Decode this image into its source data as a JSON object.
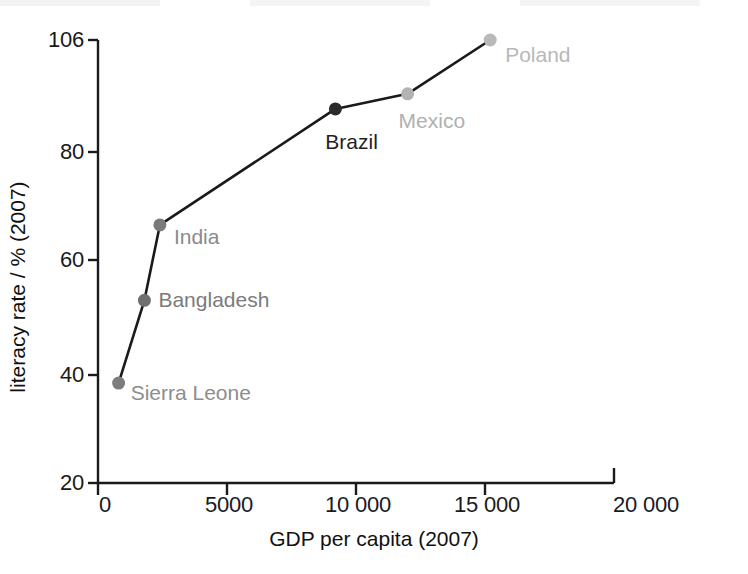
{
  "chart_data": {
    "type": "line",
    "title": "",
    "subtitle": "",
    "xlabel": "GDP per capita (2007)",
    "ylabel": "literacy rate / % (2007)",
    "xlim": [
      0,
      20000
    ],
    "ylim": [
      20,
      106
    ],
    "grid": false,
    "legend": "none",
    "xticks": [
      0,
      5000,
      10000,
      15000,
      20000
    ],
    "xticklabels": [
      "0",
      "5000",
      "10 000",
      "15 000",
      "20 000"
    ],
    "yticks": [
      20,
      40,
      60,
      80,
      106
    ],
    "yticklabels": [
      "20",
      "40",
      "60",
      "80",
      "106"
    ],
    "series": [
      {
        "name": "countries",
        "x": [
          800,
          1800,
          2400,
          9200,
          12000,
          15200
        ],
        "y": [
          38.5,
          53,
          66.5,
          90,
          93.5,
          106
        ],
        "labels": [
          "Sierra Leone",
          "Bangladesh",
          "India",
          "Brazil",
          "Mexico",
          "Poland"
        ]
      }
    ],
    "annotations": [
      {
        "text": "Sierra Leone",
        "x": 800,
        "y": 38.5,
        "color": "#8d8d8d"
      },
      {
        "text": "Bangladesh",
        "x": 1800,
        "y": 53,
        "color": "#7b7b7b"
      },
      {
        "text": "India",
        "x": 2400,
        "y": 66.5,
        "color": "#8a8a8a"
      },
      {
        "text": "Brazil",
        "x": 9200,
        "y": 90,
        "color": "#1f1f1f"
      },
      {
        "text": "Mexico",
        "x": 12000,
        "y": 93.5,
        "color": "#b0b0b0"
      },
      {
        "text": "Poland",
        "x": 15200,
        "y": 106,
        "color": "#b8b8b8"
      }
    ],
    "marker_colors": [
      "#7d7d7d",
      "#6f6f6f",
      "#7a7a7a",
      "#2b2b2b",
      "#b3b3b3",
      "#b9b9b9"
    ],
    "line_color": "#1a1a1a",
    "axis_color": "#1a1a1a",
    "background": "#ffffff"
  },
  "axes": {
    "y_title": "literacy rate / % (2007)",
    "x_title": "GDP per capita (2007)",
    "y_tick_0": "106",
    "y_tick_1": "80",
    "y_tick_2": "60",
    "y_tick_3": "40",
    "y_tick_4": "20",
    "x_tick_0": "0",
    "x_tick_1": "5000",
    "x_tick_2": "10 000",
    "x_tick_3": "15 000",
    "x_tick_4": "20 000"
  },
  "points": {
    "p0": "Sierra Leone",
    "p1": "Bangladesh",
    "p2": "India",
    "p3": "Brazil",
    "p4": "Mexico",
    "p5": "Poland"
  }
}
